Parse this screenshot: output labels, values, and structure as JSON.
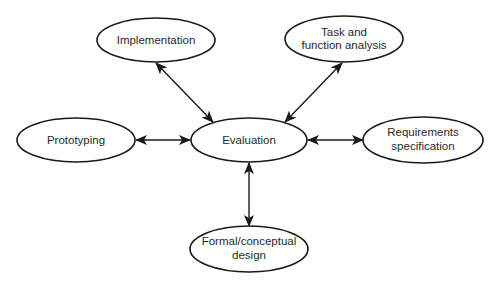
{
  "diagram": {
    "type": "star / hub-and-spoke",
    "colors": {
      "stroke": "#1a1a1a",
      "text": "#2a2a2a",
      "background": "#ffffff"
    },
    "nodes": [
      {
        "id": "evaluation",
        "lines": [
          "Evaluation"
        ]
      },
      {
        "id": "implementation",
        "lines": [
          "Implementation"
        ]
      },
      {
        "id": "task",
        "lines": [
          "Task and",
          "function analysis"
        ]
      },
      {
        "id": "prototyping",
        "lines": [
          "Prototyping"
        ]
      },
      {
        "id": "requirements",
        "lines": [
          "Requirements",
          "specification"
        ]
      },
      {
        "id": "formal",
        "lines": [
          "Formal/conceptual",
          "design"
        ]
      }
    ],
    "edges": [
      {
        "from": "evaluation",
        "to": "implementation",
        "direction": "bidirectional"
      },
      {
        "from": "evaluation",
        "to": "task",
        "direction": "bidirectional"
      },
      {
        "from": "evaluation",
        "to": "prototyping",
        "direction": "bidirectional"
      },
      {
        "from": "evaluation",
        "to": "requirements",
        "direction": "bidirectional"
      },
      {
        "from": "evaluation",
        "to": "formal",
        "direction": "bidirectional"
      }
    ]
  }
}
